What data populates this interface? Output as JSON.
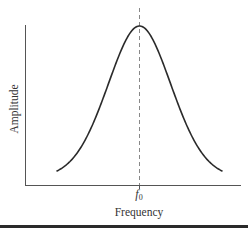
{
  "figure": {
    "ylabel": "Amplitude",
    "xlabel": "Frequency",
    "center_tick": {
      "symbol": "f",
      "subscript": "0"
    },
    "colors": {
      "curve": "#2b2b2b",
      "axes": "#555555",
      "dashed_line": "#888888",
      "bottom_rule": "#2a2a2a"
    }
  },
  "chart_data": {
    "type": "line",
    "title": "",
    "xlabel": "Frequency",
    "ylabel": "Amplitude",
    "x_ticks": [
      "f0"
    ],
    "y_ticks": [],
    "grid": false,
    "legend": null,
    "series": [
      {
        "name": "resonance curve",
        "shape": "bell (resonance)",
        "x_relative_to_f0": [
          -2.6,
          -2.0,
          -1.5,
          -1.0,
          -0.5,
          0,
          0.5,
          1.0,
          1.5,
          2.0,
          2.6
        ],
        "amplitude_normalized": [
          0.08,
          0.16,
          0.33,
          0.62,
          0.9,
          1.0,
          0.9,
          0.62,
          0.33,
          0.16,
          0.08
        ]
      }
    ],
    "annotations": [
      {
        "type": "vertical-dashed-line",
        "at": "f0"
      }
    ]
  }
}
